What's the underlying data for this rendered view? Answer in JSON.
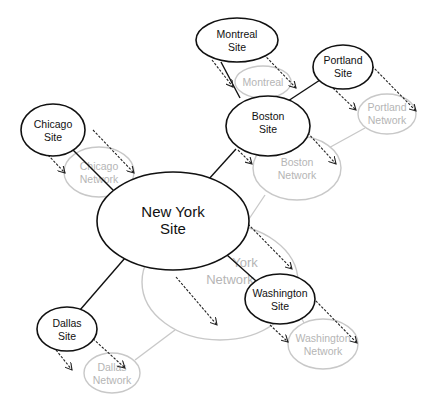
{
  "diagram": {
    "sites": [
      {
        "id": "montreal",
        "line1": "Montreal",
        "line2": "Site"
      },
      {
        "id": "portland",
        "line1": "Portland",
        "line2": "Site"
      },
      {
        "id": "boston",
        "line1": "Boston",
        "line2": "Site"
      },
      {
        "id": "chicago",
        "line1": "Chicago",
        "line2": "Site"
      },
      {
        "id": "newyork",
        "line1": "New York",
        "line2": "Site"
      },
      {
        "id": "washington",
        "line1": "Washington",
        "line2": "Site"
      },
      {
        "id": "dallas",
        "line1": "Dallas",
        "line2": "Site"
      }
    ],
    "networks": [
      {
        "id": "montreal",
        "line1": "Montreal",
        "line2": ""
      },
      {
        "id": "portland",
        "line1": "Portland",
        "line2": "Network"
      },
      {
        "id": "boston",
        "line1": "Boston",
        "line2": "Network"
      },
      {
        "id": "chicago",
        "line1": "Chicago",
        "line2": "Network"
      },
      {
        "id": "newyork",
        "line1": "York",
        "line2": "Network"
      },
      {
        "id": "washington",
        "line1": "Washington",
        "line2": "Network"
      },
      {
        "id": "dallas",
        "line1": "Dallas",
        "line2": "Network"
      }
    ],
    "colors": {
      "site_stroke": "#111111",
      "network_stroke": "#c8c8c8",
      "network_text": "#b5b5b5"
    }
  }
}
